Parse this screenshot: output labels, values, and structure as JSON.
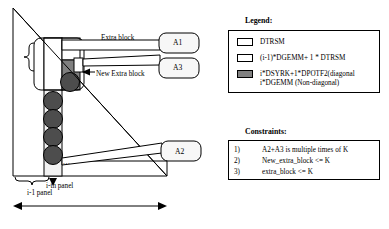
{
  "diagram": {
    "callouts": [
      {
        "id": "A1",
        "label": "A1"
      },
      {
        "id": "A3",
        "label": "A3"
      },
      {
        "id": "A2",
        "label": "A2"
      }
    ],
    "annotations": {
      "extra_block": "Extra block",
      "new_extra_block": "New Extra block",
      "ellipsis": "...",
      "ith_panel": "i-th panel",
      "i_minus_1_panel": "i-1 panel"
    }
  },
  "legend": {
    "title": "Legend:",
    "items": [
      {
        "swatch": "white",
        "text": "DTRSM"
      },
      {
        "swatch": "white",
        "text": "(i-1)*DGEMM+ 1 * DTRSM"
      },
      {
        "swatch": "gray",
        "text": "i*DSYRK+1*DPOTF2(diagonal\ni*DGEMM (Non-diagonal)",
        "line1": "i*DSYRK+1*DPOTF2(diagonal",
        "line2": "i*DGEMM (Non-diagonal)"
      }
    ]
  },
  "constraints": {
    "title": "Constraints:",
    "items": [
      {
        "num": "1)",
        "text": "A2+A3 is multiple times of K"
      },
      {
        "num": "2)",
        "text": "New_extra_block <= K"
      },
      {
        "num": "3)",
        "text": "extra_block <= K"
      }
    ]
  },
  "colors": {
    "stroke": "#000000",
    "fill_white": "#ffffff",
    "fill_light": "#f2f2f2",
    "fill_gray": "#808080",
    "fill_dark": "#4d4d4d"
  }
}
